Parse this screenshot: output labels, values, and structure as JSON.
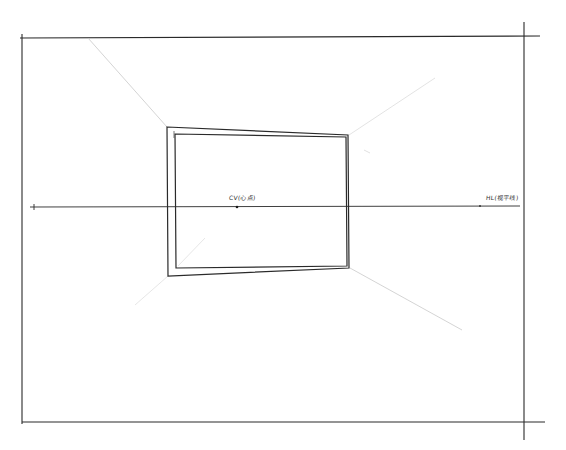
{
  "drawing": {
    "title": "One-point perspective sketch of a framed rectangle",
    "style": "hand-drawn pencil/ink on white paper",
    "colors": {
      "paper": "#ffffff",
      "ink": "#2a2a2a",
      "construction": "#c8c8c8"
    }
  },
  "labels": {
    "center_of_vision": "CV(心点)",
    "horizon_line": "HL(视平线)"
  },
  "geometry": {
    "outer_frame": {
      "left": 22,
      "top": 38,
      "right": 523,
      "bottom": 423
    },
    "horizon_y": 207,
    "center_point": {
      "x": 237,
      "y": 207
    },
    "outer_picture_frame": [
      [
        167,
        127
      ],
      [
        348,
        135
      ],
      [
        349,
        268
      ],
      [
        168,
        276
      ]
    ],
    "inner_picture_frame": [
      [
        175,
        134
      ],
      [
        346,
        137
      ],
      [
        347,
        266
      ],
      [
        176,
        268
      ]
    ],
    "construction_lines": [
      [
        [
          88,
          38
        ],
        [
          167,
          127
        ]
      ],
      [
        [
          348,
          135
        ],
        [
          430,
          80
        ]
      ],
      [
        [
          349,
          268
        ],
        [
          460,
          330
        ]
      ],
      [
        [
          168,
          276
        ],
        [
          125,
          310
        ]
      ],
      [
        [
          175,
          268
        ],
        [
          200,
          240
        ]
      ]
    ]
  }
}
